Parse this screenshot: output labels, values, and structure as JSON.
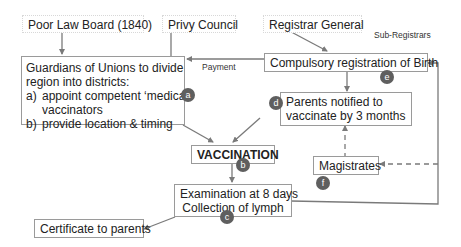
{
  "nodes": {
    "poor_law_board": "Poor Law Board (1840)",
    "privy_council": "Privy Council",
    "registrar_general": "Registrar General",
    "guardians": {
      "line1": "Guardians of Unions to divide",
      "line2": "region into districts:",
      "item_a_marker": "a)",
      "item_a_text": "appoint competent ‘medical’",
      "item_a_cont": "vaccinators",
      "item_b_marker": "b)",
      "item_b_text": "provide location & timing"
    },
    "compulsory_registration": "Compulsory registration of Birth",
    "parents_notified": {
      "line1": "Parents notified to",
      "line2": "vaccinate by 3 months"
    },
    "vaccination": "VACCINATION",
    "examination": {
      "line1": "Examination at 8 days",
      "line2": "Collection of lymph"
    },
    "magistrates": "Magistrates",
    "certificate": "Certificate to parents"
  },
  "edge_labels": {
    "payment": "Payment",
    "sub_registrars": "Sub-Registrars"
  },
  "badges": {
    "a": "a",
    "b": "b",
    "c": "c",
    "d": "d",
    "e": "e",
    "f": "f"
  },
  "colors": {
    "line": "#7a7a7a",
    "badge": "#5f5f5f",
    "box_border": "#9a9a9a"
  }
}
